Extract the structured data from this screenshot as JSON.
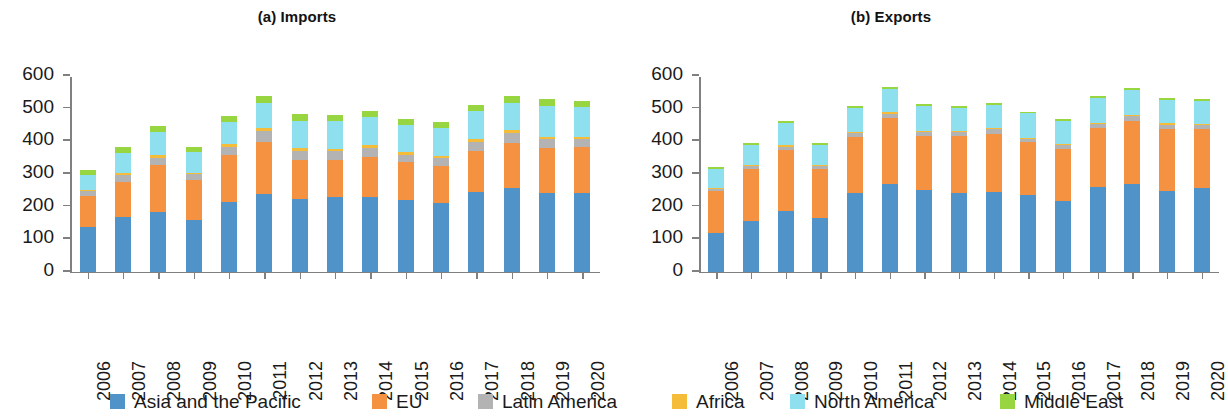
{
  "legend": {
    "position": "bottom",
    "items": [
      {
        "label": "Asia and the Pacific",
        "color": "#4f93c9",
        "key": "asia_pacific",
        "x": 110
      },
      {
        "label": "EU",
        "color": "#f59242",
        "key": "eu",
        "x": 372
      },
      {
        "label": "Latin America",
        "color": "#b3b3b3",
        "key": "latin_america",
        "x": 478
      },
      {
        "label": "Africa",
        "color": "#f5bc3a",
        "key": "africa",
        "x": 672
      },
      {
        "label": "North America",
        "color": "#8fe0ee",
        "key": "north_america",
        "x": 790
      },
      {
        "label": "Middle East",
        "color": "#97d641",
        "key": "middle_east",
        "x": 1000
      }
    ]
  },
  "axis": {
    "y_ticks": [
      0,
      100,
      200,
      300,
      400,
      500,
      600
    ],
    "y_min": 0,
    "y_max": 600,
    "x_categories": [
      "2006",
      "2007",
      "2008",
      "2009",
      "2010",
      "2011",
      "2012",
      "2013",
      "2014",
      "2015",
      "2016",
      "2017",
      "2018",
      "2019",
      "2020"
    ]
  },
  "chart_data": [
    {
      "type": "bar",
      "stacked": true,
      "title": "(a) Imports",
      "xlabel": "",
      "ylabel": "",
      "ylim": [
        0,
        600
      ],
      "grid": false,
      "legend_position": "bottom",
      "categories": [
        "2006",
        "2007",
        "2008",
        "2009",
        "2010",
        "2011",
        "2012",
        "2013",
        "2014",
        "2015",
        "2016",
        "2017",
        "2018",
        "2019",
        "2020"
      ],
      "series": [
        {
          "name": "Asia and the Pacific",
          "color": "#4f93c9",
          "values": [
            136,
            166,
            183,
            157,
            212,
            238,
            221,
            227,
            228,
            219,
            209,
            244,
            256,
            241,
            240
          ]
        },
        {
          "name": "EU",
          "color": "#f59242",
          "values": [
            95,
            109,
            144,
            124,
            144,
            160,
            120,
            115,
            123,
            115,
            114,
            124,
            137,
            137,
            140
          ]
        },
        {
          "name": "Latin America",
          "color": "#b3b3b3",
          "values": [
            14,
            20,
            22,
            17,
            26,
            33,
            28,
            26,
            28,
            24,
            24,
            28,
            30,
            27,
            25
          ]
        },
        {
          "name": "Africa",
          "color": "#f5bc3a",
          "values": [
            5,
            6,
            7,
            5,
            8,
            9,
            8,
            7,
            8,
            7,
            7,
            9,
            9,
            8,
            8
          ]
        },
        {
          "name": "North America",
          "color": "#8fe0ee",
          "values": [
            47,
            62,
            71,
            62,
            68,
            77,
            85,
            85,
            85,
            85,
            85,
            85,
            85,
            95,
            90
          ]
        },
        {
          "name": "Middle East",
          "color": "#97d641",
          "values": [
            13,
            17,
            18,
            15,
            17,
            20,
            19,
            18,
            19,
            18,
            18,
            19,
            20,
            20,
            18
          ]
        }
      ]
    },
    {
      "type": "bar",
      "stacked": true,
      "title": "(b) Exports",
      "xlabel": "",
      "ylabel": "",
      "ylim": [
        0,
        600
      ],
      "grid": false,
      "legend_position": "bottom",
      "categories": [
        "2006",
        "2007",
        "2008",
        "2009",
        "2010",
        "2011",
        "2012",
        "2013",
        "2014",
        "2015",
        "2016",
        "2017",
        "2018",
        "2019",
        "2020"
      ],
      "series": [
        {
          "name": "Asia and the Pacific",
          "color": "#4f93c9",
          "values": [
            119,
            156,
            184,
            165,
            241,
            269,
            249,
            240,
            244,
            235,
            215,
            260,
            269,
            245,
            257
          ]
        },
        {
          "name": "EU",
          "color": "#f59242",
          "values": [
            127,
            157,
            188,
            150,
            172,
            200,
            166,
            175,
            178,
            160,
            160,
            180,
            192,
            192,
            180
          ]
        },
        {
          "name": "Latin America",
          "color": "#b3b3b3",
          "values": [
            8,
            9,
            10,
            8,
            11,
            13,
            12,
            12,
            13,
            11,
            11,
            12,
            14,
            13,
            12
          ]
        },
        {
          "name": "Africa",
          "color": "#f5bc3a",
          "values": [
            3,
            4,
            4,
            3,
            4,
            5,
            4,
            4,
            4,
            4,
            4,
            4,
            5,
            4,
            4
          ]
        },
        {
          "name": "North America",
          "color": "#8fe0ee",
          "values": [
            56,
            62,
            69,
            62,
            72,
            72,
            77,
            70,
            72,
            74,
            72,
            74,
            76,
            72,
            69
          ]
        },
        {
          "name": "Middle East",
          "color": "#97d641",
          "values": [
            6,
            6,
            6,
            5,
            6,
            6,
            6,
            6,
            6,
            5,
            5,
            6,
            6,
            6,
            5
          ]
        }
      ]
    }
  ]
}
